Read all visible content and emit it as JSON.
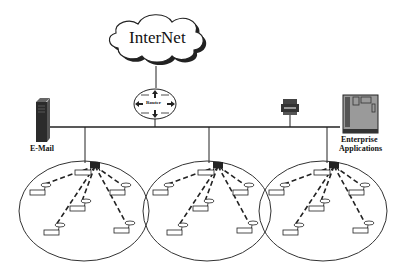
{
  "diagram": {
    "type": "network-topology",
    "internet": {
      "label": "InterNet"
    },
    "router": {
      "label": "Router"
    },
    "servers": {
      "email": {
        "label": "E-Mail"
      },
      "printer": {
        "label": ""
      },
      "enterprise": {
        "label_line1": "Enterprise",
        "label_line2": "Applications"
      }
    },
    "cells": [
      {
        "name": "cell-1",
        "hub_label": "Station",
        "node_label": "station",
        "nodes": 5
      },
      {
        "name": "cell-2",
        "hub_label": "Station",
        "node_label": "station",
        "nodes": 5
      },
      {
        "name": "cell-3",
        "hub_label": "Station",
        "node_label": "station",
        "nodes": 5
      }
    ],
    "colors": {
      "line": "#222222",
      "device": "#3a3a3a",
      "enterprise_fill": "#9a9a9a",
      "cloud_shadow": "#222222"
    }
  }
}
